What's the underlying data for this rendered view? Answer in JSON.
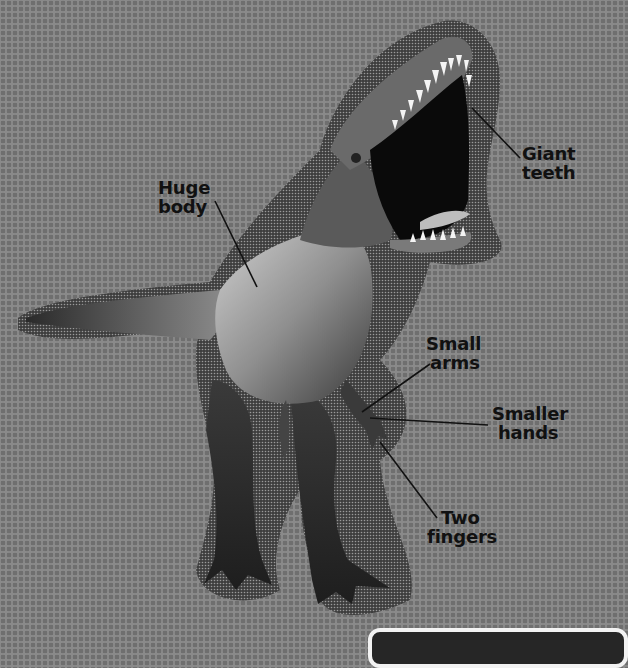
{
  "diagram": {
    "labels": [
      {
        "id": "giant-teeth",
        "lines": [
          "Giant",
          "teeth"
        ]
      },
      {
        "id": "huge-body",
        "lines": [
          "Huge",
          "body"
        ]
      },
      {
        "id": "small-arms",
        "lines": [
          "Small",
          "arms"
        ]
      },
      {
        "id": "smaller-hands",
        "lines": [
          "Smaller",
          "hands"
        ]
      },
      {
        "id": "two-fingers",
        "lines": [
          "Two",
          "fingers"
        ]
      }
    ]
  },
  "colors": {
    "background": "#8a8a8a",
    "halo": "#4a4a4a",
    "text": "#111111",
    "caption_box": "#262626",
    "caption_border": "#f2f2f2"
  }
}
